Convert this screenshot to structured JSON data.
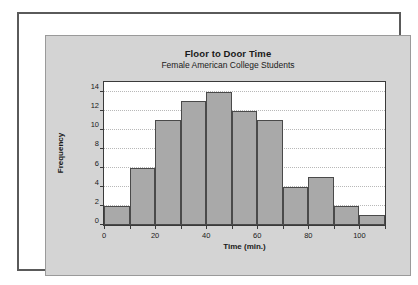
{
  "chart_data": {
    "type": "bar",
    "title": "Floor to Door Time",
    "subtitle": "Female American College Students",
    "xlabel": "Time (min.)",
    "ylabel": "Frequency",
    "categories": [
      "0-10",
      "10-20",
      "20-30",
      "30-40",
      "40-50",
      "50-60",
      "60-70",
      "70-80",
      "80-90",
      "90-100",
      "100-110"
    ],
    "bin_starts": [
      0,
      10,
      20,
      30,
      40,
      50,
      60,
      70,
      80,
      90,
      100
    ],
    "bin_width": 10,
    "values": [
      2,
      6,
      11,
      13,
      14,
      12,
      11,
      4,
      5,
      2,
      1
    ],
    "xlim": [
      0,
      110
    ],
    "ylim": [
      0,
      15
    ],
    "x_ticks": [
      0,
      10,
      20,
      30,
      40,
      50,
      60,
      70,
      80,
      90,
      100,
      110
    ],
    "x_tick_labels": [
      "0",
      "",
      "20",
      "",
      "40",
      "",
      "60",
      "",
      "80",
      "",
      "100",
      ""
    ],
    "y_ticks": [
      0,
      2,
      4,
      6,
      8,
      10,
      12,
      14
    ],
    "y_tick_labels": [
      "0",
      "2",
      "4",
      "6",
      "8",
      "10",
      "12",
      "14"
    ],
    "grid": "horizontal-dotted",
    "legend": "none",
    "bar_color": "#a9a9a9",
    "bar_border_color": "#4a4a4a",
    "plot_background": "#ffffff",
    "panel_background": "#d4d4d4"
  }
}
